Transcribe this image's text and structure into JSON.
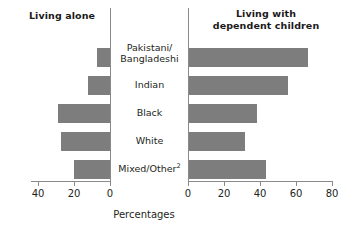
{
  "chart_data": {
    "type": "bar",
    "title": "",
    "orientation": "horizontal",
    "layout": "butterfly/back-to-back pair of panels",
    "xlabel": "Percentages",
    "ylabel": "",
    "grid": false,
    "legend": "none",
    "categories": [
      "Pakistani/Bangladeshi",
      "Indian",
      "Black",
      "White",
      "Mixed/Other"
    ],
    "category_display": [
      {
        "line1": "Pakistani/",
        "line2": "Bangladeshi",
        "superscript": ""
      },
      {
        "line1": "Indian",
        "line2": "",
        "superscript": ""
      },
      {
        "line1": "Black",
        "line2": "",
        "superscript": ""
      },
      {
        "line1": "White",
        "line2": "",
        "superscript": ""
      },
      {
        "line1": "Mixed/Other",
        "line2": "",
        "superscript": "2"
      }
    ],
    "panels": [
      {
        "id": "living-alone",
        "title": "Living alone",
        "direction": "left",
        "xlim": [
          0,
          40
        ],
        "xticks": [
          40,
          20,
          0
        ],
        "xtick_labels": [
          "40",
          "20",
          "0"
        ],
        "values": [
          7,
          12,
          29,
          27,
          20
        ]
      },
      {
        "id": "living-with-dependent-children",
        "title_line1": "Living with",
        "title_line2": "dependent children",
        "title": "Living with dependent children",
        "direction": "right",
        "xlim": [
          0,
          80
        ],
        "xticks": [
          0,
          20,
          40,
          60,
          80
        ],
        "xtick_labels": [
          "0",
          "20",
          "40",
          "60",
          "80"
        ],
        "values": [
          66,
          55,
          38,
          31,
          43
        ]
      }
    ],
    "colors": {
      "bar_fill": "#7d7d7d",
      "axis": "#8a8a8a",
      "text": "#231f20",
      "background": "#ffffff"
    }
  }
}
